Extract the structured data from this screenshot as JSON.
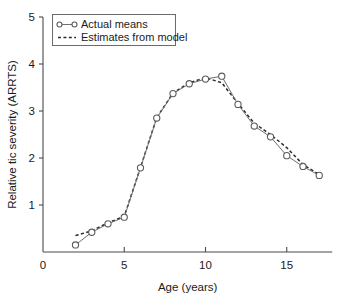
{
  "chart_data": {
    "type": "line",
    "title": "",
    "xlabel": "Age (years)",
    "ylabel": "Relative tic severity (ARRTS)",
    "xlim": [
      0,
      17.8
    ],
    "ylim": [
      0,
      5
    ],
    "xticks": [
      0,
      5,
      10,
      15
    ],
    "yticks": [
      1,
      2,
      3,
      4,
      5
    ],
    "xtick_labels": [
      "0",
      "5",
      "10",
      "15"
    ],
    "ytick_labels": [
      "1",
      "2",
      "3",
      "4",
      "5"
    ],
    "grid": false,
    "legend_position": "upper-left-inside",
    "x": [
      2,
      3,
      4,
      5,
      6,
      7,
      8,
      9,
      10,
      11,
      12,
      13,
      14,
      15,
      16,
      17
    ],
    "series": [
      {
        "name": "Actual means",
        "marker": "open-circle",
        "linestyle": "solid",
        "values": [
          0.15,
          0.42,
          0.6,
          0.74,
          1.79,
          2.85,
          3.37,
          3.58,
          3.68,
          3.74,
          3.14,
          2.68,
          2.45,
          2.05,
          1.82,
          1.63
        ]
      },
      {
        "name": "Estimates from model",
        "marker": "none",
        "linestyle": "dotted",
        "values": [
          0.35,
          0.45,
          0.62,
          0.76,
          1.8,
          2.86,
          3.38,
          3.6,
          3.71,
          3.6,
          3.16,
          2.74,
          2.5,
          2.22,
          1.86,
          1.65
        ]
      }
    ]
  },
  "legend": {
    "entries": [
      {
        "label": "Actual means"
      },
      {
        "label": "Estimates from model"
      }
    ]
  },
  "axes": {
    "x_title": "Age (years)",
    "y_title": "Relative tic severity (ARRTS)"
  }
}
